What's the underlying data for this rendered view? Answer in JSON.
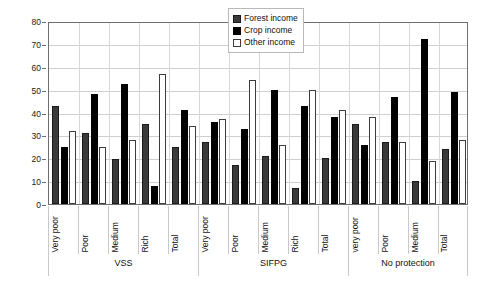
{
  "chart_data": {
    "type": "bar",
    "title": "",
    "xlabel": "",
    "ylabel": "",
    "ylim": [
      0,
      80
    ],
    "ytick_step": 10,
    "yticks": [
      0,
      10,
      20,
      30,
      40,
      50,
      60,
      70,
      80
    ],
    "grid": true,
    "legend_position": "top-right",
    "legend": [
      "Forest income",
      "Crop income",
      "Other income"
    ],
    "series": [
      {
        "name": "Forest income",
        "color": "#3a3a3a",
        "values": [
          43,
          31,
          19.5,
          35,
          25,
          27,
          17,
          21,
          7,
          20,
          35,
          27,
          10,
          24
        ]
      },
      {
        "name": "Crop income",
        "color": "#000000",
        "values": [
          25,
          48,
          52.5,
          8,
          41,
          36,
          33,
          50,
          43,
          38,
          26,
          47,
          72,
          49
        ]
      },
      {
        "name": "Other income",
        "color": "#ffffff",
        "values": [
          32,
          25,
          28,
          57,
          34,
          37,
          54,
          26,
          50,
          41,
          38,
          27,
          19,
          28
        ]
      }
    ],
    "categories": [
      "Very poor",
      "Poor",
      "Medium",
      "Rich",
      "Total",
      "Very poor",
      "Poor",
      "Medium",
      "Rich",
      "Total",
      "very poor",
      "Poor",
      "Medium",
      "Total"
    ],
    "groups": [
      {
        "label": "VSS",
        "count": 5
      },
      {
        "label": "SIFPG",
        "count": 5
      },
      {
        "label": "No protection",
        "count": 4
      }
    ]
  }
}
